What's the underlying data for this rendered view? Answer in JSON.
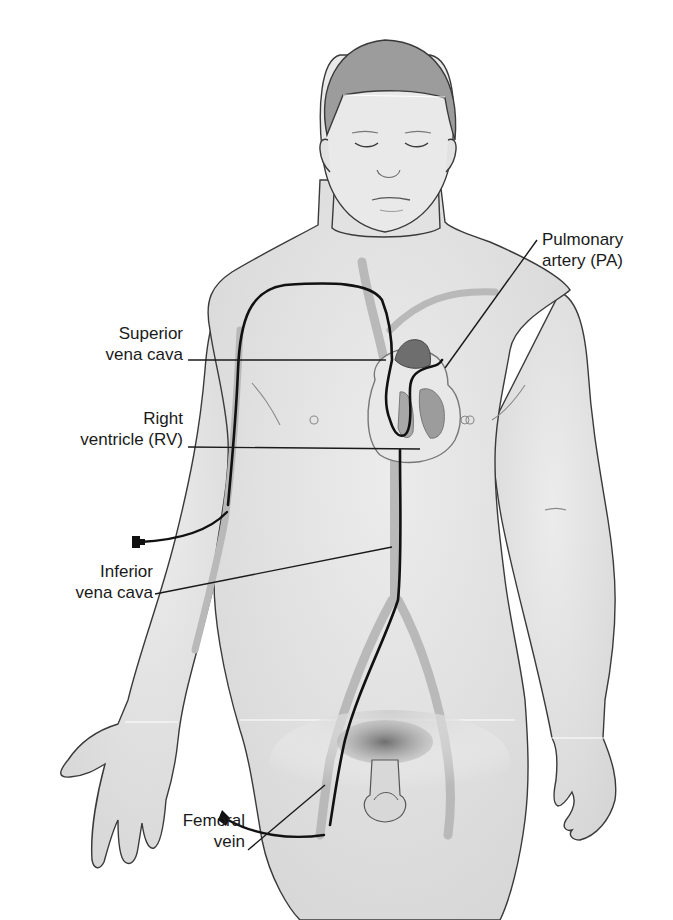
{
  "figure": {
    "colors": {
      "skin": "#e6e6e6",
      "skin_shadow": "#cfcfcf",
      "outline": "#3a3a3a",
      "vessel": "#b9b9b9",
      "catheter": "#111111",
      "hair": "#8f8f8f",
      "heart": "#8a8a8a",
      "label_text": "#1a1a1a"
    }
  },
  "labels": [
    {
      "id": "pulmonary-artery",
      "lines": [
        "Pulmonary",
        "artery (PA)"
      ]
    },
    {
      "id": "superior-vena-cava",
      "lines": [
        "Superior",
        "vena cava"
      ]
    },
    {
      "id": "right-ventricle",
      "lines": [
        "Right",
        "ventricle (RV)"
      ]
    },
    {
      "id": "inferior-vena-cava",
      "lines": [
        "Inferior",
        "vena cava"
      ]
    },
    {
      "id": "femoral-vein",
      "lines": [
        "Femoral",
        "vein"
      ]
    }
  ]
}
